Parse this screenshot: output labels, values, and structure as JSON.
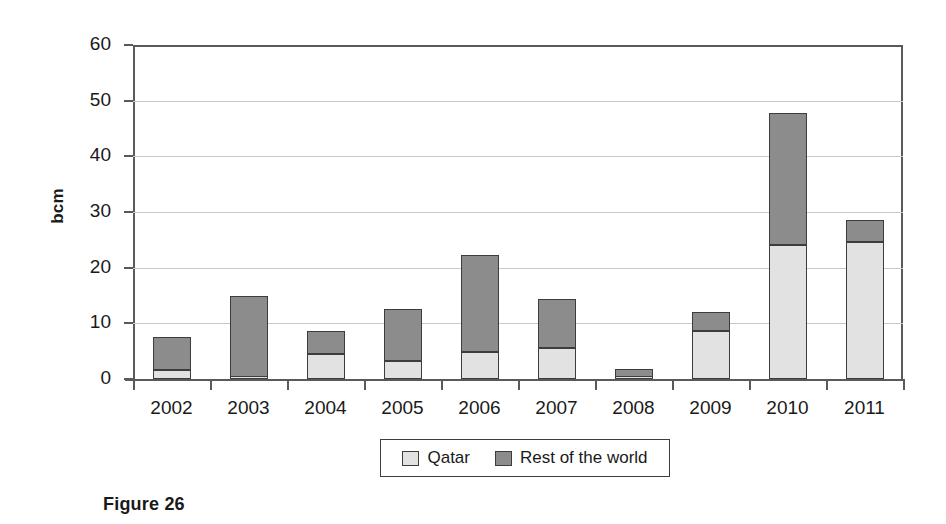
{
  "caption": "Figure 26",
  "chart_data": {
    "type": "bar",
    "subtype": "stacked",
    "title": "",
    "xlabel": "",
    "ylabel": "bcm",
    "ylim": [
      0,
      60
    ],
    "yticks": [
      0,
      10,
      20,
      30,
      40,
      50,
      60
    ],
    "ytick_labels": [
      "0",
      "10",
      "20",
      "30",
      "40",
      "50",
      "60"
    ],
    "grid": true,
    "grid_axis": "y",
    "legend_position": "bottom",
    "categories": [
      "2002",
      "2003",
      "2004",
      "2005",
      "2006",
      "2007",
      "2008",
      "2009",
      "2010",
      "2011"
    ],
    "series": [
      {
        "name": "Qatar",
        "color": "#e2e2e2",
        "values": [
          1.6,
          0.3,
          4.5,
          3.2,
          4.9,
          5.6,
          0.4,
          8.7,
          24.1,
          24.6
        ]
      },
      {
        "name": "Rest of the world",
        "color": "#8c8c8c",
        "values": [
          5.9,
          14.7,
          4.2,
          9.4,
          17.3,
          8.7,
          1.4,
          3.4,
          23.7,
          3.9
        ]
      }
    ],
    "totals": [
      7.5,
      15.0,
      8.7,
      12.6,
      22.2,
      14.3,
      1.8,
      12.1,
      47.8,
      28.5
    ]
  },
  "legend": {
    "entries": [
      {
        "label": "Qatar",
        "swatch_name": "legend-swatch-qatar"
      },
      {
        "label": "Rest of the world",
        "swatch_name": "legend-swatch-rest-of-the-world"
      }
    ]
  },
  "colors": {
    "qatar": "#e2e2e2",
    "rest_of_world": "#8c8c8c",
    "axis": "#5a5a5a",
    "gridline": "#c9c9c9",
    "bar_outline": "#3d3d3d",
    "background": "#ffffff"
  }
}
